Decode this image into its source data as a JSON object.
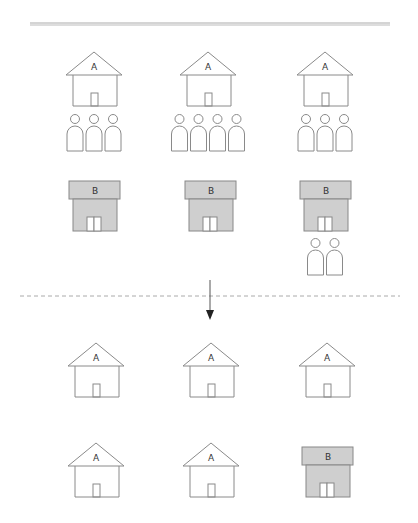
{
  "title": "",
  "colors": {
    "line": "#999999",
    "stroke": "#8a8a8a",
    "house_b_fill": "#cfcfcf",
    "arrow": "#222222",
    "background": "#ffffff"
  },
  "divider": {
    "style": "double",
    "x1": 30,
    "x2": 390,
    "y": 23
  },
  "separator": {
    "style": "dashed",
    "x1": 20,
    "x2": 400,
    "y": 296
  },
  "arrow": {
    "x": 210,
    "y1": 280,
    "y2": 320
  },
  "before": {
    "houses_a": [
      {
        "label": "A",
        "cx": 94,
        "top": 52,
        "people": 3
      },
      {
        "label": "A",
        "cx": 208,
        "top": 52,
        "people": 4
      },
      {
        "label": "A",
        "cx": 325,
        "top": 52,
        "people": 3
      }
    ],
    "houses_b": [
      {
        "label": "B",
        "cx": 94,
        "top": 181,
        "people": 0
      },
      {
        "label": "B",
        "cx": 210,
        "top": 181,
        "people": 0
      },
      {
        "label": "B",
        "cx": 325,
        "top": 181,
        "people": 2
      }
    ]
  },
  "after": {
    "row1": [
      {
        "type": "A",
        "label": "A",
        "cx": 96,
        "top": 343
      },
      {
        "type": "A",
        "label": "A",
        "cx": 211,
        "top": 343
      },
      {
        "type": "A",
        "label": "A",
        "cx": 327,
        "top": 343
      }
    ],
    "row2": [
      {
        "type": "A",
        "label": "A",
        "cx": 96,
        "top": 443
      },
      {
        "type": "A",
        "label": "A",
        "cx": 211,
        "top": 443
      },
      {
        "type": "B",
        "label": "B",
        "cx": 327,
        "top": 447
      }
    ]
  }
}
